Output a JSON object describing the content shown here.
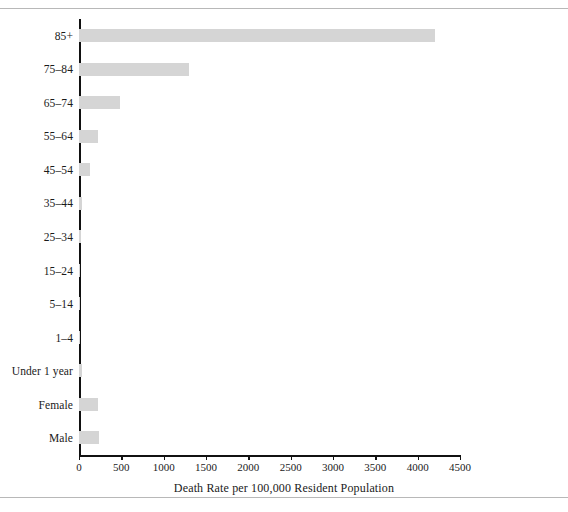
{
  "figure": {
    "rules": [
      "page-rule-top",
      "page-rule-bottom"
    ]
  },
  "chart_data": {
    "type": "bar",
    "orientation": "horizontal",
    "title": "",
    "xlabel": "Death Rate per 100,000 Resident Population",
    "ylabel": "",
    "xlim": [
      0,
      4500
    ],
    "xticks": [
      0,
      500,
      1000,
      1500,
      2000,
      2500,
      3000,
      3500,
      4000,
      4500
    ],
    "xticklabels": [
      "0",
      "500",
      "1000",
      "1500",
      "2000",
      "2500",
      "3000",
      "3500",
      "4000",
      "4500"
    ],
    "grid": false,
    "legend": null,
    "bar_color": "#d5d5d5",
    "axis_color": "#111111",
    "categories": [
      "85+",
      "75–84",
      "65–74",
      "55–64",
      "45–54",
      "35–44",
      "25–34",
      "15–24",
      "5–14",
      "1–4",
      "Under 1 year",
      "Female",
      "Male"
    ],
    "values": [
      4200,
      1300,
      480,
      225,
      130,
      40,
      20,
      14,
      8,
      12,
      30,
      220,
      232
    ]
  }
}
